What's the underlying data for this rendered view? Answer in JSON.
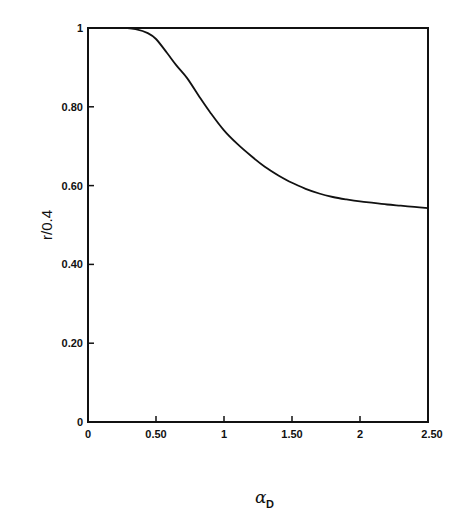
{
  "chart_data": {
    "type": "line",
    "title": "",
    "xlabel": "α_D",
    "xlabel_main": "α",
    "xlabel_sub": "D",
    "ylabel": "r/0.4",
    "xlim": [
      0,
      2.5
    ],
    "ylim": [
      0,
      1
    ],
    "grid": false,
    "legend": null,
    "x_ticks": [
      0,
      0.5,
      1,
      1.5,
      2,
      2.5
    ],
    "x_tick_labels": [
      "0",
      "0.50",
      "1",
      "1.50",
      "2",
      "2.50"
    ],
    "y_ticks": [
      0,
      0.2,
      0.4,
      0.6,
      0.8,
      1
    ],
    "y_tick_labels": [
      "0",
      "0.20",
      "0.40",
      "0.60",
      "0.80",
      "1"
    ],
    "series": [
      {
        "name": "r/0.4 vs α_D",
        "x": [
          0,
          0.1,
          0.2,
          0.29,
          0.35,
          0.44,
          0.5,
          0.58,
          0.65,
          0.73,
          0.82,
          0.9,
          1.0,
          1.1,
          1.2,
          1.3,
          1.4,
          1.5,
          1.6,
          1.7,
          1.8,
          1.9,
          2.0,
          2.1,
          2.2,
          2.3,
          2.4,
          2.5
        ],
        "y": [
          1.0,
          1.0,
          1.0,
          1.0,
          0.997,
          0.987,
          0.972,
          0.937,
          0.905,
          0.872,
          0.825,
          0.785,
          0.74,
          0.705,
          0.675,
          0.648,
          0.626,
          0.607,
          0.592,
          0.58,
          0.571,
          0.565,
          0.56,
          0.556,
          0.552,
          0.549,
          0.546,
          0.543
        ]
      }
    ]
  }
}
